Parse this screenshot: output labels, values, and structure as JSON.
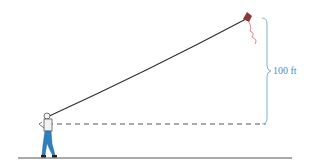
{
  "diagram": {
    "type": "kite-height-illustration",
    "height_label": "100 ft",
    "colors": {
      "string": "#333333",
      "dashed_line": "#555555",
      "ground": "#555555",
      "brace": "#7ab3d6",
      "label": "#4a8fc0",
      "kite": "#8a3a3a",
      "kite_tail": "#d9606a",
      "person_shirt": "#f2f2f2",
      "person_pants": "#2f7fc0"
    }
  }
}
